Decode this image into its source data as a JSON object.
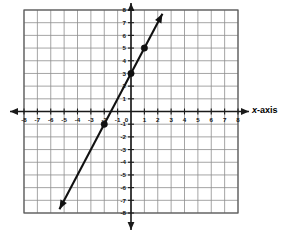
{
  "figure": {
    "kind": "coordinate-plane-line-graph",
    "background_color": "#ffffff",
    "grid_color": "#8e8e8e",
    "axis_color": "#1a1a1a",
    "line_color": "#111111",
    "point_color": "#111111"
  },
  "labels": {
    "x_axis_caption_italic": "x",
    "x_axis_caption_rest": "-axis"
  },
  "chart_data": {
    "type": "line",
    "title": "",
    "xlabel": "x-axis",
    "ylabel": "",
    "xlim": [
      -8,
      8
    ],
    "ylim": [
      -8,
      8
    ],
    "grid": true,
    "legend": "none",
    "x_ticks": [
      -8,
      -7,
      -6,
      -5,
      -4,
      -3,
      -2,
      -1,
      0,
      1,
      2,
      3,
      4,
      5,
      6,
      7,
      8
    ],
    "x_tick_labels": [
      "-8",
      "-7",
      "-6",
      "-5",
      "-4",
      "-3",
      "-2",
      "-1",
      "0",
      "1",
      "2",
      "3",
      "4",
      "5",
      "6",
      "7",
      "8"
    ],
    "y_ticks": [
      -8,
      -7,
      -6,
      -5,
      -4,
      -3,
      -2,
      -1,
      0,
      1,
      2,
      3,
      4,
      5,
      6,
      7,
      8
    ],
    "y_tick_labels": [
      "-8",
      "-7",
      "-6",
      "-5",
      "-4",
      "-3",
      "-2",
      "-1",
      "0",
      "1",
      "2",
      "3",
      "4",
      "5",
      "6",
      "7",
      "8"
    ],
    "series": [
      {
        "name": "y = 2x + 3",
        "equation": "y = 2x + 3",
        "slope": 2,
        "y_intercept": 3,
        "x_intercept": -1.5,
        "style": "solid-double-arrow",
        "endpoints": [
          {
            "x": -5.35,
            "y": -7.7
          },
          {
            "x": 2.35,
            "y": 7.7
          }
        ],
        "marked_points": [
          {
            "x": -2,
            "y": -1
          },
          {
            "x": 0,
            "y": 3
          },
          {
            "x": 1,
            "y": 5
          }
        ]
      }
    ]
  }
}
